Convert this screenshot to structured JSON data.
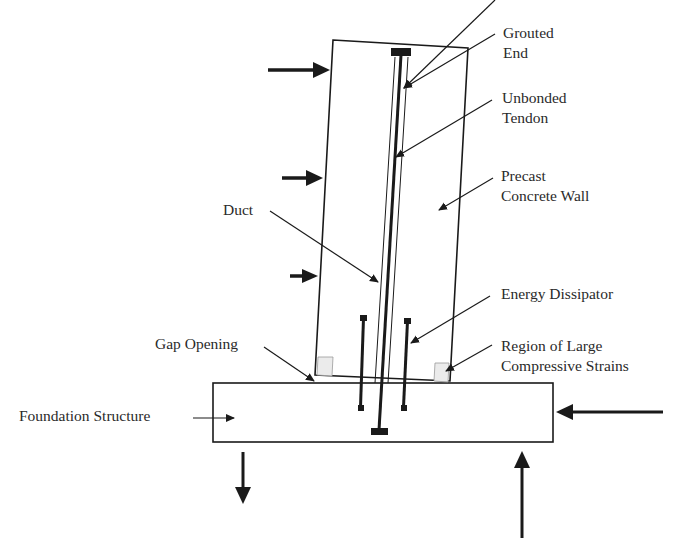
{
  "diagram": {
    "labels": {
      "grouted_end": [
        "Grouted",
        "End"
      ],
      "unbonded_tendon": [
        "Unbonded",
        "Tendon"
      ],
      "precast_wall": [
        "Precast",
        "Concrete Wall"
      ],
      "duct": "Duct",
      "energy_dissipator": "Energy Dissipator",
      "gap_opening": "Gap Opening",
      "compressive_region": [
        "Region of Large",
        "Compressive Strains"
      ],
      "foundation": "Foundation Structure"
    },
    "components": [
      "precast-concrete-wall",
      "foundation-structure",
      "unbonded-tendon",
      "duct",
      "grouted-end-anchor",
      "bottom-anchor",
      "energy-dissipator-left",
      "energy-dissipator-right",
      "gap-opening",
      "compressive-strain-region-left",
      "compressive-strain-region-right"
    ],
    "loads": [
      {
        "name": "lateral-load-top",
        "direction": "right"
      },
      {
        "name": "lateral-load-middle",
        "direction": "right"
      },
      {
        "name": "lateral-load-bottom",
        "direction": "right"
      },
      {
        "name": "foundation-horizontal-reaction",
        "direction": "left"
      },
      {
        "name": "foundation-vertical-reaction-left",
        "direction": "down"
      },
      {
        "name": "foundation-vertical-reaction-right",
        "direction": "up"
      }
    ],
    "colors": {
      "line": "#1a1a1a",
      "strain_region_fill": "#ebebeb",
      "background": "#ffffff"
    }
  }
}
